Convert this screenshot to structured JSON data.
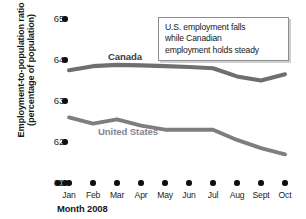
{
  "axes": {
    "y_title_line1": "Employment-to-population ratio",
    "y_title_line2": "(percentage of population)",
    "x_title": "Month 2008",
    "y_ticks": [
      "65",
      "64",
      "63",
      "62",
      "61"
    ],
    "x_ticks": [
      "Jan",
      "Feb",
      "Mar",
      "Apr",
      "May",
      "Jun",
      "Jul",
      "Aug",
      "Sept",
      "Oct"
    ]
  },
  "annotation": {
    "line1": "U.S. employment falls",
    "line2": "while Canadian",
    "line3": "employment holds steady"
  },
  "series_labels": {
    "canada": "Canada",
    "united_states": "United States"
  },
  "colors": {
    "canada_line": "#6e6e73",
    "us_line": "#7d7d82",
    "axis_marker": "#111114",
    "text": "#17171a",
    "annotation_border": "#8d8d91"
  },
  "chart_data": {
    "type": "line",
    "title": "",
    "xlabel": "Month 2008",
    "ylabel": "Employment-to-population ratio (percentage of population)",
    "categories": [
      "Jan",
      "Feb",
      "Mar",
      "Apr",
      "May",
      "Jun",
      "Jul",
      "Aug",
      "Sept",
      "Oct"
    ],
    "ylim": [
      61,
      65
    ],
    "yticks": [
      61,
      62,
      63,
      64,
      65
    ],
    "grid": false,
    "legend": "inline-series-labels",
    "series": [
      {
        "name": "Canada",
        "values": [
          63.75,
          63.85,
          63.88,
          63.87,
          63.85,
          63.83,
          63.8,
          63.6,
          63.5,
          63.65
        ]
      },
      {
        "name": "United States",
        "values": [
          62.6,
          62.45,
          62.55,
          62.4,
          62.3,
          62.3,
          62.3,
          62.05,
          61.85,
          61.7
        ]
      }
    ],
    "annotations": [
      {
        "text": "U.S. employment falls while Canadian employment holds steady",
        "x": "Jun",
        "y": 64.8
      }
    ]
  }
}
